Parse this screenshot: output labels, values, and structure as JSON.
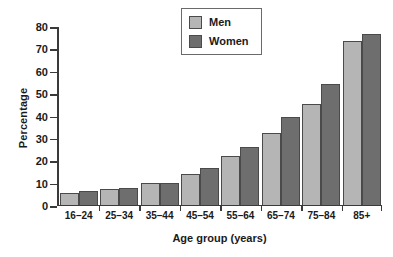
{
  "chart_data": {
    "type": "bar",
    "title": "",
    "xlabel": "Age group (years)",
    "ylabel": "Percentage",
    "categories": [
      "16–24",
      "25–34",
      "35–44",
      "45–54",
      "55–64",
      "65–74",
      "75–84",
      "85+"
    ],
    "series": [
      {
        "name": "Men",
        "color": "#b5b5b5",
        "values": [
          5,
          7,
          9.5,
          13.5,
          21.5,
          32,
          45,
          73
        ]
      },
      {
        "name": "Women",
        "color": "#6e6e6e",
        "values": [
          6,
          7.5,
          9.5,
          16.5,
          25.5,
          39,
          54,
          76
        ]
      }
    ],
    "ylim": [
      0,
      80
    ],
    "yticks": [
      0,
      10,
      20,
      30,
      40,
      50,
      60,
      70,
      80
    ],
    "ytick_labels": [
      "0",
      "10",
      "20",
      "30",
      "40",
      "50",
      "60",
      "70",
      "80"
    ],
    "grid": false,
    "legend_position": "top-center",
    "legend_entries": [
      "Men",
      "Women"
    ]
  }
}
